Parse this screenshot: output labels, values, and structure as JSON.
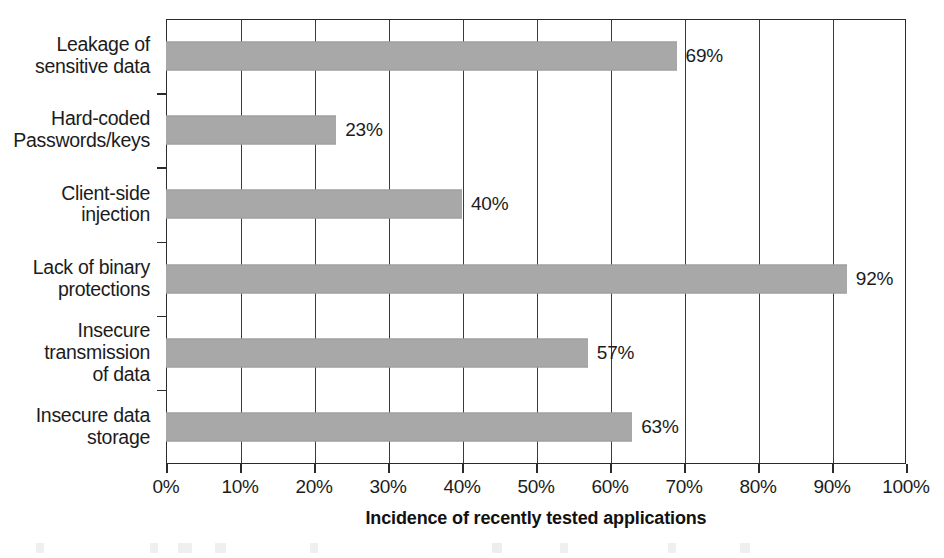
{
  "chart_data": {
    "type": "bar",
    "orientation": "horizontal",
    "title": "",
    "subtitle": "",
    "xlabel": "Incidence of recently tested applications",
    "ylabel": "",
    "xlim": [
      0,
      100
    ],
    "xtick_labels": [
      "0%",
      "10%",
      "20%",
      "30%",
      "40%",
      "50%",
      "60%",
      "70%",
      "80%",
      "90%",
      "100%"
    ],
    "xtick_values": [
      0,
      10,
      20,
      30,
      40,
      50,
      60,
      70,
      80,
      90,
      100
    ],
    "grid": true,
    "grid_axis": "x",
    "legend": false,
    "legend_position": "none",
    "bar_color": "#a8a8a8",
    "axis_color": "#2b2b2b",
    "categories": [
      "Leakage of sensitive data",
      "Hard-coded Passwords/keys",
      "Client-side injection",
      "Lack of binary protections",
      "Insecure transmission of data",
      "Insecure data storage"
    ],
    "category_lines": [
      [
        "Leakage of",
        "sensitive data"
      ],
      [
        "Hard-coded",
        "Passwords/keys"
      ],
      [
        "Client-side",
        "injection"
      ],
      [
        "Lack of binary",
        "protections"
      ],
      [
        "Insecure",
        "transmission",
        "of data"
      ],
      [
        "Insecure data",
        "storage"
      ]
    ],
    "values": [
      69,
      23,
      40,
      92,
      57,
      63
    ],
    "data_labels": [
      "69%",
      "23%",
      "40%",
      "92%",
      "57%",
      "63%"
    ]
  }
}
